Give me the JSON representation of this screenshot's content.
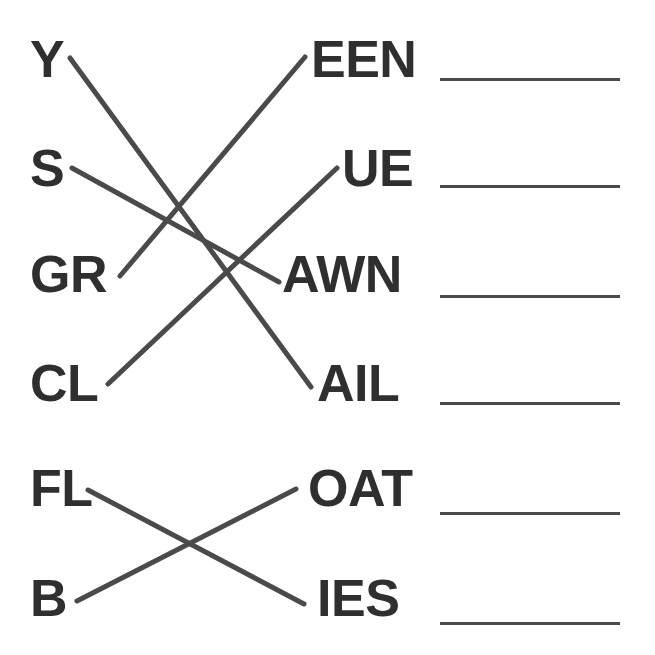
{
  "worksheet": {
    "title": "Word Matching Worksheet",
    "background_color": "#ffffff",
    "text_color": "#2f2f2f",
    "line_color": "#4a4a4a"
  },
  "groups": [
    {
      "id": "group-1",
      "left_items": [
        {
          "id": "L1",
          "label": "Y",
          "x": 30,
          "y": 33
        },
        {
          "id": "L2",
          "label": "S",
          "x": 30,
          "y": 142
        },
        {
          "id": "L3",
          "label": "GR",
          "x": 30,
          "y": 248
        },
        {
          "id": "L4",
          "label": "CL",
          "x": 30,
          "y": 357
        }
      ],
      "right_items": [
        {
          "id": "R1",
          "label": "EEN",
          "x": 311,
          "y": 33
        },
        {
          "id": "R2",
          "label": "UE",
          "x": 342,
          "y": 142
        },
        {
          "id": "R3",
          "label": "AWN",
          "x": 282,
          "y": 248
        },
        {
          "id": "R4",
          "label": "AIL",
          "x": 317,
          "y": 357
        }
      ],
      "connections": [
        {
          "id": "C1",
          "from": "Y",
          "to": "AIL",
          "x1": 70,
          "y1": 58,
          "x2": 311,
          "y2": 387
        },
        {
          "id": "C2",
          "from": "S",
          "to": "AWN",
          "x1": 72,
          "y1": 168,
          "x2": 279,
          "y2": 282
        },
        {
          "id": "C3",
          "from": "GR",
          "to": "EEN",
          "x1": 120,
          "y1": 276,
          "x2": 305,
          "y2": 57
        },
        {
          "id": "C4",
          "from": "CL",
          "to": "UE",
          "x1": 108,
          "y1": 384,
          "x2": 337,
          "y2": 168
        }
      ]
    },
    {
      "id": "group-2",
      "left_items": [
        {
          "id": "L5",
          "label": "FL",
          "x": 30,
          "y": 462
        },
        {
          "id": "L6",
          "label": "B",
          "x": 30,
          "y": 572
        }
      ],
      "right_items": [
        {
          "id": "R5",
          "label": "OAT",
          "x": 308,
          "y": 462
        },
        {
          "id": "R6",
          "label": "IES",
          "x": 317,
          "y": 572
        }
      ],
      "connections": [
        {
          "id": "C5",
          "from": "FL",
          "to": "IES",
          "x1": 88,
          "y1": 490,
          "x2": 304,
          "y2": 604
        },
        {
          "id": "C6",
          "from": "B",
          "to": "OAT",
          "x1": 77,
          "y1": 601,
          "x2": 296,
          "y2": 489
        }
      ]
    }
  ],
  "answer_blanks": [
    {
      "id": "blank-1",
      "value": "",
      "x": 440,
      "y": 78,
      "width": 180
    },
    {
      "id": "blank-2",
      "value": "",
      "x": 440,
      "y": 185,
      "width": 180
    },
    {
      "id": "blank-3",
      "value": "",
      "x": 440,
      "y": 295,
      "width": 180
    },
    {
      "id": "blank-4",
      "value": "",
      "x": 440,
      "y": 402,
      "width": 180
    },
    {
      "id": "blank-5",
      "value": "",
      "x": 440,
      "y": 512,
      "width": 180
    },
    {
      "id": "blank-6",
      "value": "",
      "x": 440,
      "y": 622,
      "width": 180
    }
  ]
}
